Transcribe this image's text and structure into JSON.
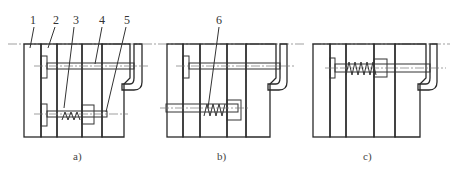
{
  "figure": {
    "panels": [
      {
        "id": "a",
        "caption": "a)"
      },
      {
        "id": "b",
        "caption": "b)"
      },
      {
        "id": "c",
        "caption": "c)"
      }
    ],
    "part_labels": [
      {
        "number": "1"
      },
      {
        "number": "2"
      },
      {
        "number": "3"
      },
      {
        "number": "4"
      },
      {
        "number": "5"
      },
      {
        "number": "6"
      }
    ]
  },
  "colors": {
    "line": "#333333",
    "hatch": "#444444",
    "background": "#ffffff"
  }
}
